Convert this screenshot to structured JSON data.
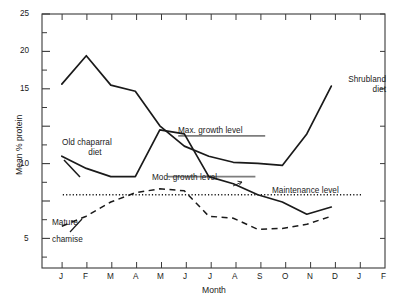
{
  "chart_data": {
    "type": "line",
    "title": "",
    "xlabel": "Month",
    "ylabel": "Mean % protein",
    "ylim": [
      0,
      25
    ],
    "yticks": [
      0,
      5,
      10,
      15,
      20,
      25
    ],
    "ytick_labels": [
      "",
      "5",
      "10",
      "15",
      "20",
      "25"
    ],
    "yminor": [
      2.5,
      7.5,
      12.5,
      17.5,
      22.5
    ],
    "grid": false,
    "legend_position": "inline-annotations",
    "x": [
      "J",
      "F",
      "M",
      "A",
      "M",
      "J",
      "J",
      "A",
      "S",
      "O",
      "N",
      "D",
      "J",
      "F"
    ],
    "xtick_labels": [
      "J",
      "F",
      "M",
      "A",
      "M",
      "J",
      "J",
      "A",
      "S",
      "O",
      "N",
      "D",
      "J",
      "F"
    ],
    "series": [
      {
        "name": "Shrubland diet",
        "style": "solid",
        "color": "#1a1a1a",
        "x": [
          "J",
          "F",
          "M",
          "A",
          "M",
          "J",
          "J",
          "A",
          "S",
          "O",
          "N",
          "D"
        ],
        "values": [
          18.1,
          20.9,
          18.0,
          17.4,
          14.0,
          12.0,
          11.0,
          10.4,
          10.3,
          10.1,
          13.2,
          17.9
        ]
      },
      {
        "name": "Old chaparral diet",
        "style": "solid",
        "color": "#1a1a1a",
        "x": [
          "J",
          "F",
          "M",
          "A",
          "M",
          "J",
          "J",
          "A",
          "S",
          "O",
          "N",
          "D"
        ],
        "values": [
          11.0,
          9.8,
          9.0,
          9.0,
          13.6,
          13.2,
          9.0,
          8.3,
          7.2,
          6.5,
          5.3,
          6.0
        ]
      },
      {
        "name": "Mature chamise",
        "style": "dashed",
        "color": "#1a1a1a",
        "x": [
          "J",
          "F",
          "M",
          "A",
          "M",
          "J",
          "J",
          "A",
          "S",
          "O",
          "N",
          "D"
        ],
        "values": [
          4.1,
          5.1,
          6.5,
          7.4,
          7.8,
          7.6,
          5.1,
          4.9,
          3.8,
          3.9,
          4.3,
          5.1
        ]
      }
    ],
    "reference_lines": [
      {
        "label": "Max. growth level",
        "value": 13.0,
        "style": "solid"
      },
      {
        "label": "Mod. growth level",
        "value": 9.0,
        "style": "solid"
      },
      {
        "label": "Maintenance level",
        "value": 7.2,
        "style": "dotted"
      }
    ],
    "annotations": [
      {
        "name": "shrubland-diet-label",
        "text": "Shrubland\ndiet"
      },
      {
        "name": "old-chaparral-diet-label",
        "text": "Old chaparral\ndiet"
      },
      {
        "name": "mature-chamise-label",
        "text": "Mature\nchamise"
      }
    ]
  },
  "labels": {
    "y_axis_title": "Mean % protein",
    "x_axis_title": "Month",
    "shrubland_line1": "Shrubland",
    "shrubland_line2": "diet",
    "chaparral_line1": "Old chaparral",
    "chaparral_line2": "diet",
    "chamise_line1": "Mature",
    "chamise_line2": "chamise",
    "max_growth": "Max. growth level",
    "mod_growth": "Mod. growth level",
    "maintenance": "Maintenance level",
    "y5": "5",
    "y10": "10",
    "y15": "15",
    "y20": "20",
    "y25": "25",
    "m1": "J",
    "m2": "F",
    "m3": "M",
    "m4": "A",
    "m5": "M",
    "m6": "J",
    "m7": "J",
    "m8": "A",
    "m9": "S",
    "m10": "O",
    "m11": "N",
    "m12": "D",
    "m13": "J",
    "m14": "F"
  },
  "colors": {
    "line": "#1a1a1a",
    "axis": "#3a3a3a",
    "background": "#ffffff"
  }
}
